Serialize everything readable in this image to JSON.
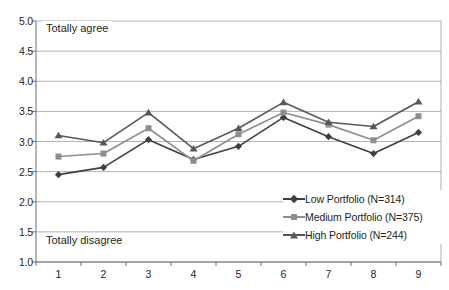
{
  "chart_data": {
    "type": "line",
    "title": "",
    "xlabel": "",
    "ylabel": "",
    "categories": [
      "1",
      "2",
      "3",
      "4",
      "5",
      "6",
      "7",
      "8",
      "9"
    ],
    "ylim": [
      1.0,
      5.0
    ],
    "ytick_labels": [
      "1.0",
      "1.5",
      "2.0",
      "2.5",
      "3.0",
      "3.5",
      "4.0",
      "4.5",
      "5.0"
    ],
    "ytick_values": [
      1.0,
      1.5,
      2.0,
      2.5,
      3.0,
      3.5,
      4.0,
      4.5,
      5.0
    ],
    "grid": true,
    "legend_position": "inside-bottom-right",
    "annotations": [
      {
        "text": "Totally agree",
        "value": 5.0,
        "position": "top-left"
      },
      {
        "text": "Totally disagree",
        "value": 1.0,
        "position": "bottom-left"
      }
    ],
    "series": [
      {
        "name": "Low Portfolio (N=314)",
        "marker": "diamond",
        "color": "#3f3f41",
        "values": [
          2.45,
          2.57,
          3.03,
          2.7,
          2.92,
          3.4,
          3.08,
          2.8,
          3.15
        ]
      },
      {
        "name": "Medium Portfolio (N=375)",
        "marker": "square",
        "color": "#8e8e90",
        "values": [
          2.75,
          2.8,
          3.22,
          2.68,
          3.12,
          3.48,
          3.28,
          3.02,
          3.42
        ]
      },
      {
        "name": "High Portfolio (N=244)",
        "marker": "triangle",
        "color": "#58585b",
        "values": [
          3.1,
          2.98,
          3.48,
          2.88,
          3.22,
          3.65,
          3.32,
          3.25,
          3.66
        ]
      }
    ]
  },
  "legend": {
    "items": [
      {
        "label": "Low Portfolio (N=314)"
      },
      {
        "label": "Medium Portfolio (N=375)"
      },
      {
        "label": "High Portfolio (N=244)"
      }
    ]
  },
  "annotations": {
    "top_left": "Totally agree",
    "bottom_left": "Totally disagree"
  },
  "colors": {
    "low": "#3f3f41",
    "medium": "#8e8e90",
    "high": "#58585b",
    "grid": "#a7a9ac",
    "axis": "#6d6e71",
    "text": "#231f20",
    "background": "#ffffff"
  }
}
